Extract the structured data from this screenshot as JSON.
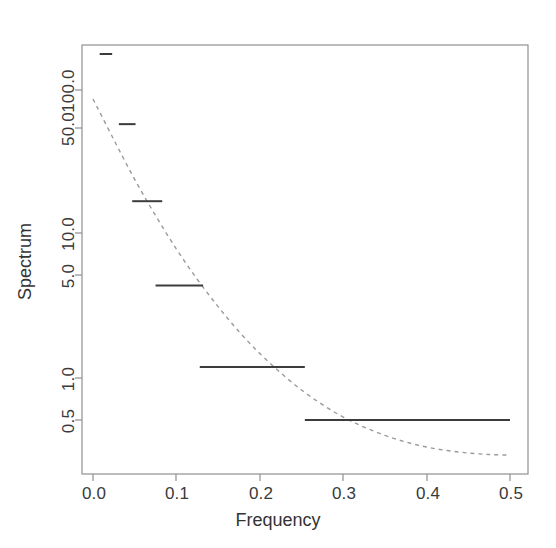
{
  "figure": {
    "background_color": "#ffffff",
    "frame_color": "#808080",
    "axis_text_color": "#3a3a3a",
    "width": 556,
    "height": 548
  },
  "chart_data": {
    "type": "line",
    "title": "",
    "subtitle": "",
    "xlabel": "Frequency",
    "ylabel": "Spectrum",
    "xlim": [
      0.0,
      0.5
    ],
    "ylim": [
      0.25,
      260
    ],
    "yscale": "log10",
    "xscale": "linear",
    "grid": false,
    "legend": null,
    "xticks": [
      0.0,
      0.1,
      0.2,
      0.3,
      0.4,
      0.5
    ],
    "xticklabels": [
      "0.0",
      "0.1",
      "0.2",
      "0.3",
      "0.4",
      "0.5"
    ],
    "yticks": [
      0.5,
      1.0,
      5.0,
      10.0,
      50.0,
      100.0
    ],
    "yticklabels": [
      "0.5",
      "1.0",
      "5.0",
      "10.0",
      "50.0",
      "100.0"
    ],
    "series": [
      {
        "name": "Smoothed periodogram estimate",
        "style": "step",
        "linestyle": "solid",
        "color": "#3c3c3c",
        "linewidth": 2,
        "description": "Piecewise-constant step estimate of the spectrum over frequency bands",
        "bands": [
          {
            "x_start": 0.008,
            "x_end": 0.023,
            "value": 210.0
          },
          {
            "x_start": 0.031,
            "x_end": 0.051,
            "value": 66.0
          },
          {
            "x_start": 0.047,
            "x_end": 0.083,
            "value": 18.5
          },
          {
            "x_start": 0.075,
            "x_end": 0.132,
            "value": 4.6
          },
          {
            "x_start": 0.128,
            "x_end": 0.254,
            "value": 1.2
          },
          {
            "x_start": 0.254,
            "x_end": 0.5,
            "value": 0.5
          }
        ],
        "x": [
          0.008,
          0.023,
          0.031,
          0.051,
          0.047,
          0.083,
          0.075,
          0.132,
          0.128,
          0.254,
          0.254,
          0.5
        ],
        "y": [
          210.0,
          210.0,
          66.0,
          66.0,
          18.5,
          18.5,
          4.6,
          4.6,
          1.2,
          1.2,
          0.5,
          0.5
        ]
      },
      {
        "name": "Theoretical spectral density",
        "style": "curve",
        "linestyle": "dashed",
        "color": "#9a9a9a",
        "linewidth": 1.4,
        "description": "Smooth decaying reference spectral density curve",
        "x": [
          0.0,
          0.025,
          0.05,
          0.075,
          0.1,
          0.125,
          0.15,
          0.175,
          0.2,
          0.225,
          0.25,
          0.275,
          0.3,
          0.325,
          0.35,
          0.375,
          0.4,
          0.425,
          0.45,
          0.475,
          0.5
        ],
        "y": [
          100.0,
          51.0,
          26.5,
          14.6,
          8.4,
          5.1,
          3.25,
          2.15,
          1.5,
          1.09,
          0.82,
          0.645,
          0.525,
          0.445,
          0.388,
          0.348,
          0.32,
          0.302,
          0.29,
          0.283,
          0.28
        ]
      }
    ]
  },
  "axes": {
    "x_title": "Frequency",
    "y_title": "Spectrum"
  }
}
